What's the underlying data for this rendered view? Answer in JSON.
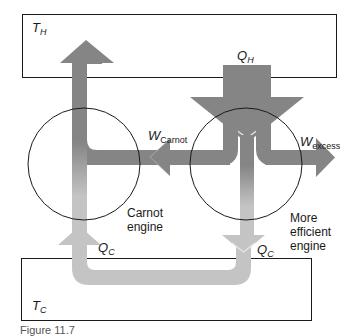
{
  "diagram": {
    "hot_reservoir": {
      "symbol": "T",
      "subscript": "H"
    },
    "cold_reservoir": {
      "symbol": "T",
      "subscript": "C"
    },
    "heat_in": {
      "symbol": "Q",
      "subscript": "H"
    },
    "heat_out_carnot": {
      "symbol": "Q",
      "subscript": "C"
    },
    "heat_out_efficient": {
      "symbol": "Q",
      "subscript": "C"
    },
    "work_carnot": {
      "symbol": "W",
      "subscript": "Carnot"
    },
    "work_excess": {
      "symbol": "W",
      "subscript": "excess"
    },
    "carnot_engine": {
      "line1": "Carnot",
      "line2": "engine"
    },
    "efficient_engine": {
      "line1": "More",
      "line2": "efficient",
      "line3": "engine"
    },
    "caption": "Figure 11.7"
  },
  "colors": {
    "arrow_dark": "#858585",
    "arrow_light": "#c4c4c4",
    "outline": "#1a1a1a",
    "background": "#ffffff"
  }
}
